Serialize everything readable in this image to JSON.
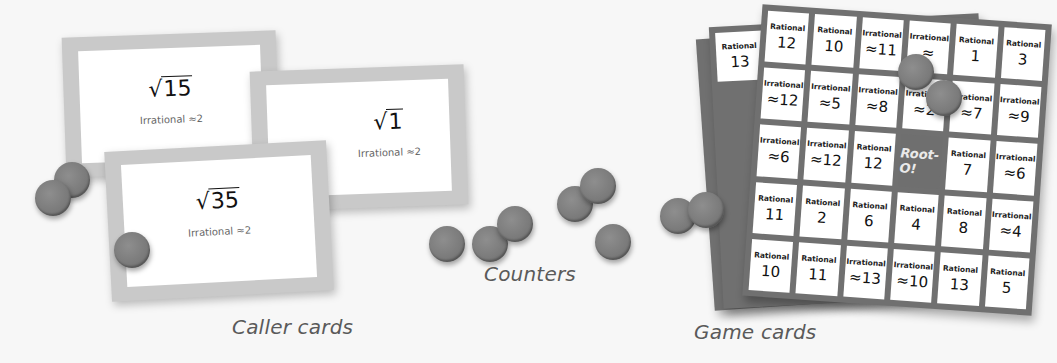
{
  "caller_cards": {
    "label": "Caller cards",
    "cards": [
      {
        "radicand": "15",
        "note": "Irrational ≈2"
      },
      {
        "radicand": "1",
        "note": "Irrational ≈2"
      },
      {
        "radicand": "35",
        "note": "Irrational ≈2"
      }
    ]
  },
  "counters": {
    "label": "Counters"
  },
  "game_cards": {
    "label": "Game cards",
    "center_logo": "Root-O!",
    "front_grid": [
      [
        {
          "kind": "Rational",
          "value": "12"
        },
        {
          "kind": "Rational",
          "value": "10"
        },
        {
          "kind": "Irrational",
          "value": "≈11"
        },
        {
          "kind": "Irrational",
          "value": "≈"
        },
        {
          "kind": "Rational",
          "value": "1"
        }
      ],
      [
        {
          "kind": "Irrational",
          "value": "≈12"
        },
        {
          "kind": "Irrational",
          "value": "≈5"
        },
        {
          "kind": "Irrational",
          "value": "≈8"
        },
        {
          "kind": "Irrational",
          "value": "≈2"
        },
        {
          "kind": "Irrational",
          "value": "≈7"
        }
      ],
      [
        {
          "kind": "Irrational",
          "value": "≈6"
        },
        {
          "kind": "Irrational",
          "value": "≈12"
        },
        {
          "kind": "Rational",
          "value": "12"
        },
        {
          "kind": "free",
          "value": "Root-O!"
        },
        {
          "kind": "Rational",
          "value": "7"
        }
      ],
      [
        {
          "kind": "Rational",
          "value": "11"
        },
        {
          "kind": "Rational",
          "value": "2"
        },
        {
          "kind": "Rational",
          "value": "6"
        },
        {
          "kind": "Rational",
          "value": "4"
        },
        {
          "kind": "Rational",
          "value": "8"
        }
      ],
      [
        {
          "kind": "Rational",
          "value": "10"
        },
        {
          "kind": "Rational",
          "value": "11"
        },
        {
          "kind": "Irrational",
          "value": "≈13"
        },
        {
          "kind": "Irrational",
          "value": "≈10"
        },
        {
          "kind": "Rational",
          "value": "13"
        }
      ]
    ],
    "right_column": [
      {
        "kind": "Rational",
        "value": "3"
      },
      {
        "kind": "Irrational",
        "value": "≈9"
      },
      {
        "kind": "Irrational",
        "value": "≈6"
      },
      {
        "kind": "Irrational",
        "value": "≈4"
      },
      {
        "kind": "Rational",
        "value": "5"
      }
    ],
    "back_card_partial": [
      {
        "kind": "Rational",
        "value": "13"
      },
      {
        "kind": "Irrational",
        "value": "≈"
      },
      {
        "kind": "Irrational",
        "value": ""
      }
    ]
  },
  "colors": {
    "background": "#f7f7f7",
    "card_border": "#c9c9c9",
    "board_frame": "#707070",
    "counter": "#7a7a7a",
    "caption": "#5a5a5a"
  }
}
